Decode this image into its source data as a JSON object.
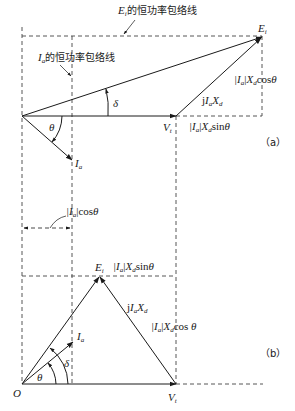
{
  "diagram": {
    "type": "phasor-diagram",
    "colors": {
      "line": "#1a1a1a",
      "dashed": "#444444",
      "background": "#ffffff"
    },
    "panel_a": {
      "tag": "（a）",
      "labels": {
        "ei_envelope": {
          "var": "E",
          "sub": "i",
          "text": "的恒功率包络线"
        },
        "ia_envelope": {
          "var": "I",
          "sub": "a",
          "text": "的恒功率包络线"
        },
        "ei": {
          "var": "E",
          "sub": "i"
        },
        "vt": {
          "var": "V",
          "sub": "t"
        },
        "ia": {
          "var": "I",
          "sub": "a"
        },
        "delta": "δ",
        "theta": "θ",
        "jiaxd": {
          "prefix": "j",
          "var1": "I",
          "sub1": "a",
          "var2": "X",
          "sub2": "d"
        },
        "cos_term": {
          "abs": "|I",
          "sub": "a",
          "close": "|",
          "x": "X",
          "xsub": "d",
          "fn": "cos",
          "angle": "θ"
        },
        "sin_term": {
          "abs": "|I",
          "sub": "a",
          "close": "|",
          "x": "X",
          "xsub": "d",
          "fn": "sin",
          "angle": "θ"
        },
        "ia_cos": {
          "abs": "|I",
          "sub": "a",
          "close": "|",
          "fn": "cos",
          "angle": "θ"
        }
      }
    },
    "panel_b": {
      "tag": "（b）",
      "labels": {
        "ei": {
          "var": "E",
          "sub": "i"
        },
        "vt": {
          "var": "V",
          "sub": "t"
        },
        "ia": {
          "var": "I",
          "sub": "a"
        },
        "origin": "O",
        "delta": "δ",
        "theta": "θ",
        "jiaxd": {
          "prefix": "j",
          "var1": "I",
          "sub1": "a",
          "var2": "X",
          "sub2": "d"
        },
        "sin_term": {
          "abs": "|I",
          "sub": "a",
          "close": "|",
          "x": "X",
          "xsub": "d",
          "fn": "sin",
          "angle": "θ"
        },
        "cos_term": {
          "abs": "|I",
          "sub": "a",
          "close": "|",
          "x": "X",
          "xsub": "d",
          "fn": "cos ",
          "angle": "θ"
        }
      }
    }
  }
}
